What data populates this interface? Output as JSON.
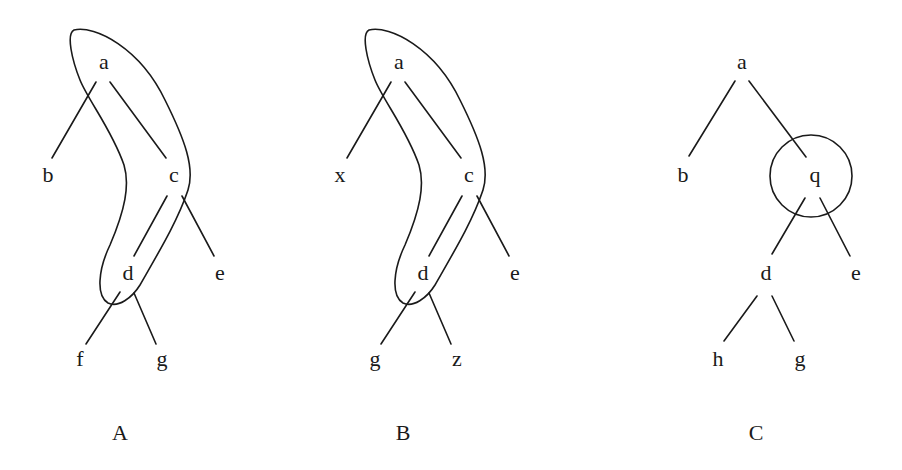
{
  "figure": {
    "background": "#ffffff",
    "ink": "#1a1a1a",
    "panels": [
      {
        "id": "A",
        "label": "A",
        "nodes": {
          "root": "a",
          "left": "b",
          "mid": "c",
          "midRight": "e",
          "low": "d",
          "leafLeft": "f",
          "leafRight": "g"
        },
        "highlight": "boomerang enclosing a, c, d"
      },
      {
        "id": "B",
        "label": "B",
        "nodes": {
          "root": "a",
          "left": "x",
          "mid": "c",
          "midRight": "e",
          "low": "d",
          "leafLeft": "g",
          "leafRight": "z"
        },
        "highlight": "boomerang enclosing a, c, d"
      },
      {
        "id": "C",
        "label": "C",
        "nodes": {
          "root": "a",
          "left": "b",
          "mid": "q",
          "midRight": "e",
          "low": "d",
          "leafLeft": "h",
          "leafRight": "g"
        },
        "highlight": "circle enclosing q"
      }
    ]
  }
}
